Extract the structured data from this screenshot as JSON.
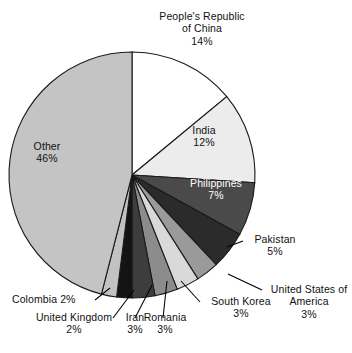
{
  "chart_data": {
    "type": "pie",
    "title": "",
    "subtitle": "",
    "xlabel": "",
    "ylabel": "",
    "legend_position": "none",
    "grid": false,
    "unit": "%",
    "categories": [
      "People's Republic of China",
      "India",
      "Philippines",
      "Pakistan",
      "United States of America",
      "South Korea",
      "Romania",
      "Iran",
      "United Kingdom",
      "Colombia",
      "Other"
    ],
    "values": [
      14,
      12,
      7,
      5,
      3,
      3,
      3,
      3,
      2,
      2,
      46
    ],
    "slices": [
      {
        "label": "People's Republic of China",
        "label_line1": "People's Republic",
        "label_line2": "of China",
        "value": 14,
        "value_text": "14%",
        "color": "#ffffff",
        "label_placement": "outside-top"
      },
      {
        "label": "India",
        "label_line1": "India",
        "label_line2": "",
        "value": 12,
        "value_text": "12%",
        "color": "#ececec",
        "label_placement": "inside"
      },
      {
        "label": "Philippines",
        "label_line1": "Philippines",
        "label_line2": "",
        "value": 7,
        "value_text": "7%",
        "color": "#4a4a4a",
        "label_placement": "inside"
      },
      {
        "label": "Pakistan",
        "label_line1": "Pakistan",
        "label_line2": "",
        "value": 5,
        "value_text": "5%",
        "color": "#2b2b2b",
        "label_placement": "outside"
      },
      {
        "label": "United States of America",
        "label_line1": "United States of",
        "label_line2": "America",
        "value": 3,
        "value_text": "3%",
        "color": "#9a9a9a",
        "label_placement": "outside-leader"
      },
      {
        "label": "South Korea",
        "label_line1": "South Korea",
        "label_line2": "",
        "value": 3,
        "value_text": "3%",
        "color": "#d9d9d9",
        "label_placement": "outside-leader"
      },
      {
        "label": "Romania",
        "label_line1": "Romania",
        "label_line2": "",
        "value": 3,
        "value_text": "3%",
        "color": "#8c8c8c",
        "label_placement": "outside-leader"
      },
      {
        "label": "Iran",
        "label_line1": "Iran",
        "label_line2": "",
        "value": 3,
        "value_text": "3%",
        "color": "#3d3d3d",
        "label_placement": "outside-leader"
      },
      {
        "label": "United Kingdom",
        "label_line1": "United Kingdom",
        "label_line2": "",
        "value": 2,
        "value_text": "2%",
        "color": "#141414",
        "label_placement": "outside-leader"
      },
      {
        "label": "Colombia",
        "label_line1": "Colombia 2%",
        "label_line2": "",
        "value": 2,
        "value_text": "",
        "color": "#c2c2c2",
        "label_placement": "outside-leader"
      },
      {
        "label": "Other",
        "label_line1": "Other",
        "label_line2": "",
        "value": 46,
        "value_text": "46%",
        "color": "#c4c4c4",
        "label_placement": "inside"
      }
    ]
  },
  "labels": {
    "china_l1": "People's Republic",
    "china_l2": "of China",
    "china_val": "14%",
    "india_name": "India",
    "india_val": "12%",
    "philippines_name": "Philippines",
    "philippines_val": "7%",
    "pakistan_name": "Pakistan",
    "pakistan_val": "5%",
    "usa_l1": "United States of",
    "usa_l2": "America",
    "usa_val": "3%",
    "korea_name": "South Korea",
    "korea_val": "3%",
    "romania_name": "Romania",
    "romania_val": "3%",
    "iran_name": "Iran",
    "iran_val": "3%",
    "uk_name": "United Kingdom",
    "uk_val": "2%",
    "colombia_name": "Colombia 2%",
    "other_name": "Other",
    "other_val": "46%"
  }
}
